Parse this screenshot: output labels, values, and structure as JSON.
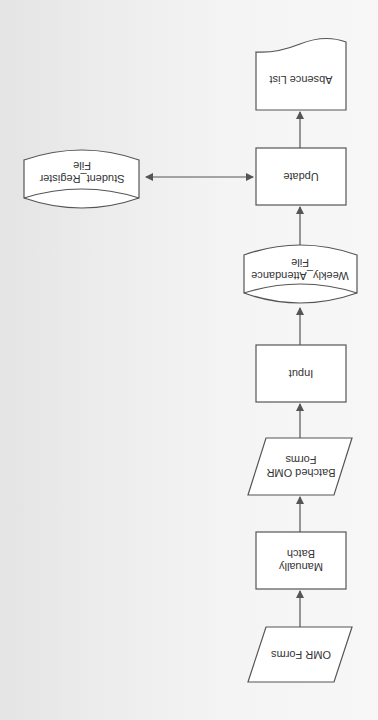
{
  "diagram": {
    "type": "system-flowchart",
    "orientation": "rotated-180",
    "colors": {
      "stroke": "#555555",
      "fill": "#ffffff",
      "background": "#f0f0f0",
      "text": "#333333"
    },
    "nodes": [
      {
        "id": "omr_forms",
        "shape": "parallelogram",
        "label": "OMR Forms"
      },
      {
        "id": "manually_batch",
        "shape": "process",
        "label": "Manually Batch"
      },
      {
        "id": "batched_omr_forms",
        "shape": "parallelogram",
        "label": "Batched OMR Forms"
      },
      {
        "id": "input",
        "shape": "process",
        "label": "Input"
      },
      {
        "id": "weekly_attendance_file",
        "shape": "cylinder",
        "label": "Weekly_Attendance File"
      },
      {
        "id": "update",
        "shape": "process",
        "label": "Update"
      },
      {
        "id": "student_register_file",
        "shape": "cylinder",
        "label": "Student_Register File"
      },
      {
        "id": "absence_list",
        "shape": "document",
        "label": "Absence List"
      }
    ],
    "edges": [
      {
        "from": "omr_forms",
        "to": "manually_batch"
      },
      {
        "from": "manually_batch",
        "to": "batched_omr_forms"
      },
      {
        "from": "batched_omr_forms",
        "to": "input"
      },
      {
        "from": "input",
        "to": "weekly_attendance_file"
      },
      {
        "from": "weekly_attendance_file",
        "to": "update"
      },
      {
        "from": "update",
        "to": "student_register_file",
        "bidirectional": true
      },
      {
        "from": "update",
        "to": "absence_list"
      }
    ]
  }
}
